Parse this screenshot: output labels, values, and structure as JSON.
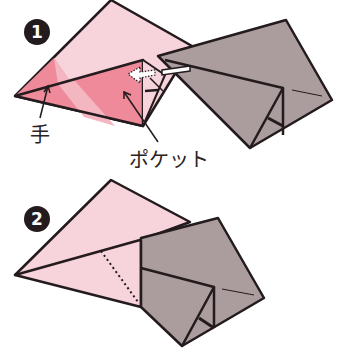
{
  "steps": [
    {
      "number": "1",
      "labels": {
        "hand": "手",
        "pocket": "ポケット"
      }
    },
    {
      "number": "2"
    }
  ],
  "colors": {
    "light_pink": "#f7d3db",
    "dark_pink": "#ee8a99",
    "mid_pink": "#f4afbb",
    "grey": "#ab9c9e",
    "outline": "#231b1d",
    "badge": "#231b1d"
  }
}
